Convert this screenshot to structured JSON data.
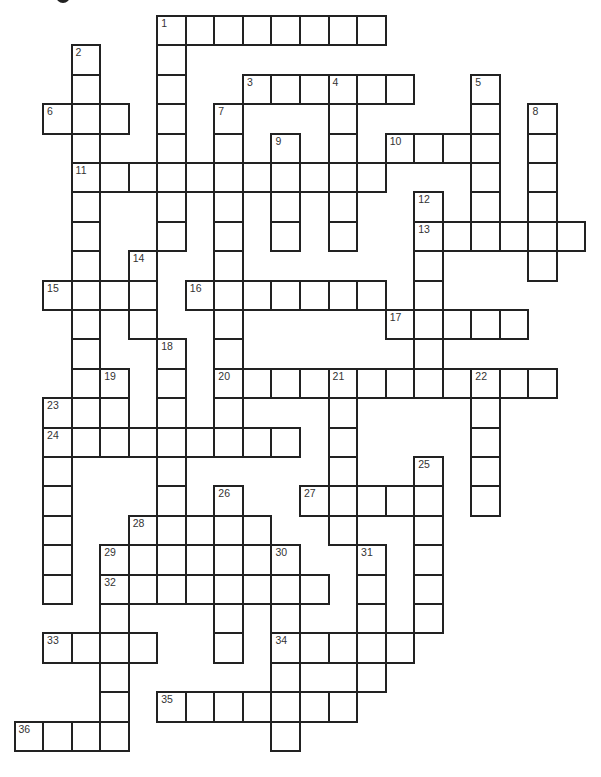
{
  "puzzle": {
    "grid": {
      "origin_x": 14.5,
      "origin_y": 16,
      "cell_w": 28.55,
      "cell_h": 29.4,
      "cols": 20,
      "rows": 25
    },
    "colors": {
      "border": "#222222",
      "number": "#333333",
      "background": "#ffffff"
    },
    "across": [
      {
        "num": "1",
        "row": 0,
        "col": 5,
        "len": 8
      },
      {
        "num": "3",
        "row": 2,
        "col": 8,
        "len": 6
      },
      {
        "num": "6",
        "row": 3,
        "col": 1,
        "len": 3
      },
      {
        "num": "10",
        "row": 4,
        "col": 13,
        "len": 4
      },
      {
        "num": "11",
        "row": 5,
        "col": 2,
        "len": 11
      },
      {
        "num": "13",
        "row": 7,
        "col": 14,
        "len": 6
      },
      {
        "num": "15",
        "row": 9,
        "col": 1,
        "len": 4
      },
      {
        "num": "16",
        "row": 9,
        "col": 6,
        "len": 7
      },
      {
        "num": "17",
        "row": 10,
        "col": 13,
        "len": 5
      },
      {
        "num": "20",
        "row": 12,
        "col": 7,
        "len": 12
      },
      {
        "num": "24",
        "row": 14,
        "col": 1,
        "len": 9
      },
      {
        "num": "27",
        "row": 16,
        "col": 10,
        "len": 5
      },
      {
        "num": "28",
        "row": 17,
        "col": 4,
        "len": 5
      },
      {
        "num": "29",
        "row": 18,
        "col": 3,
        "len": 7
      },
      {
        "num": "32",
        "row": 19,
        "col": 3,
        "len": 8
      },
      {
        "num": "33",
        "row": 21,
        "col": 1,
        "len": 4
      },
      {
        "num": "34",
        "row": 21,
        "col": 9,
        "len": 5
      },
      {
        "num": "35",
        "row": 23,
        "col": 5,
        "len": 7
      },
      {
        "num": "36",
        "row": 24,
        "col": 0,
        "len": 4
      }
    ],
    "down": [
      {
        "num": "1",
        "row": 0,
        "col": 5,
        "len": 8
      },
      {
        "num": "2",
        "row": 1,
        "col": 2,
        "len": 12
      },
      {
        "num": "4",
        "row": 2,
        "col": 11,
        "len": 6
      },
      {
        "num": "5",
        "row": 2,
        "col": 16,
        "len": 6
      },
      {
        "num": "7",
        "row": 3,
        "col": 7,
        "len": 12
      },
      {
        "num": "8",
        "row": 3,
        "col": 18,
        "len": 6
      },
      {
        "num": "9",
        "row": 4,
        "col": 9,
        "len": 4
      },
      {
        "num": "12",
        "row": 6,
        "col": 14,
        "len": 7
      },
      {
        "num": "14",
        "row": 8,
        "col": 4,
        "len": 3
      },
      {
        "num": "18",
        "row": 11,
        "col": 5,
        "len": 9
      },
      {
        "num": "19",
        "row": 12,
        "col": 3,
        "len": 3
      },
      {
        "num": "21",
        "row": 12,
        "col": 11,
        "len": 6
      },
      {
        "num": "22",
        "row": 12,
        "col": 16,
        "len": 5
      },
      {
        "num": "23",
        "row": 13,
        "col": 1,
        "len": 7
      },
      {
        "num": "25",
        "row": 15,
        "col": 14,
        "len": 6
      },
      {
        "num": "26",
        "row": 16,
        "col": 7,
        "len": 6
      },
      {
        "num": "29",
        "row": 18,
        "col": 3,
        "len": 7
      },
      {
        "num": "30",
        "row": 18,
        "col": 9,
        "len": 7
      },
      {
        "num": "31",
        "row": 18,
        "col": 12,
        "len": 5
      }
    ]
  }
}
